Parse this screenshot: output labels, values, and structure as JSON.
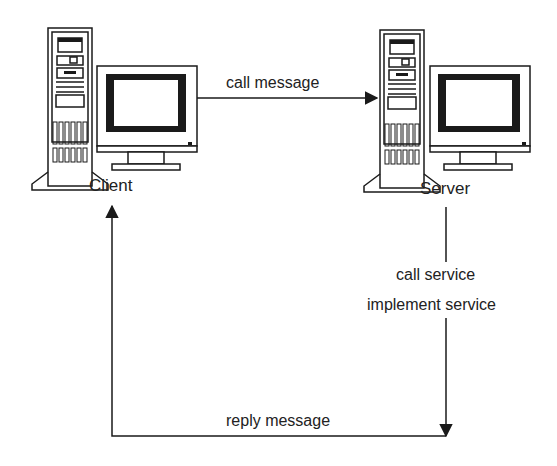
{
  "diagram": {
    "type": "client-server RPC flow",
    "nodes": [
      {
        "id": "client",
        "label": "Client",
        "icon": "desktop-computer-icon"
      },
      {
        "id": "server",
        "label": "Server",
        "icon": "desktop-computer-icon"
      }
    ],
    "edges": [
      {
        "from": "client",
        "to": "server",
        "label": "call message"
      },
      {
        "from": "server",
        "to": "server",
        "label_lines": [
          "call service",
          "implement service"
        ]
      },
      {
        "from": "server",
        "to": "client",
        "label": "reply message"
      }
    ]
  },
  "labels": {
    "client": "Client",
    "server": "Server",
    "call_message": "call message",
    "call_service": "call service",
    "implement_service": "implement service",
    "reply_message": "reply message"
  },
  "colors": {
    "line": "#1a1a1a",
    "background": "#ffffff"
  }
}
